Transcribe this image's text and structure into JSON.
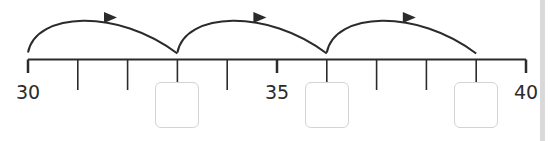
{
  "number_line": {
    "start": 30,
    "end": 40,
    "step": 1,
    "labels": [
      {
        "value": 30,
        "text": "30"
      },
      {
        "value": 35,
        "text": "35"
      },
      {
        "value": 40,
        "text": "40"
      }
    ],
    "answer_boxes": [
      {
        "value_position": 33,
        "text": ""
      },
      {
        "value_position": 36,
        "text": ""
      },
      {
        "value_position": 39,
        "text": ""
      }
    ],
    "jumps": [
      {
        "from": 30,
        "to": 33,
        "direction": "right"
      },
      {
        "from": 33,
        "to": 36,
        "direction": "right"
      },
      {
        "from": 36,
        "to": 39,
        "direction": "right"
      }
    ]
  },
  "colors": {
    "line": "#2b2b2b",
    "box_border": "#d3d3d3",
    "edge_strip": "#d9d9d9"
  }
}
